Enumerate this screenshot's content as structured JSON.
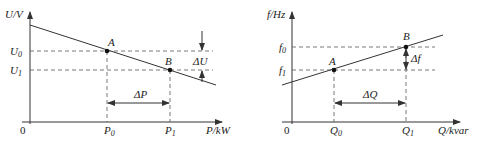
{
  "colors": {
    "line": "#333333",
    "dash": "#555555",
    "text": "#222222",
    "background": "#ffffff"
  },
  "left_chart": {
    "y_axis_label": "U/V",
    "x_axis_label": "P/kW",
    "origin_label": "0",
    "y_ticks": [
      {
        "base": "U",
        "sub": "0"
      },
      {
        "base": "U",
        "sub": "1"
      }
    ],
    "x_ticks": [
      {
        "base": "P",
        "sub": "0"
      },
      {
        "base": "P",
        "sub": "1"
      }
    ],
    "points": [
      {
        "label": "A"
      },
      {
        "label": "B"
      }
    ],
    "delta_x_label": "ΔP",
    "delta_y_label": "ΔU",
    "line_trend": "decreasing"
  },
  "right_chart": {
    "y_axis_label": "f/Hz",
    "x_axis_label": "Q/kvar",
    "origin_label": "0",
    "y_ticks": [
      {
        "base": "f",
        "sub": "0"
      },
      {
        "base": "f",
        "sub": "1"
      }
    ],
    "x_ticks": [
      {
        "base": "Q",
        "sub": "0"
      },
      {
        "base": "Q",
        "sub": "1"
      }
    ],
    "points": [
      {
        "label": "A"
      },
      {
        "label": "B"
      }
    ],
    "delta_x_label": "ΔQ",
    "delta_y_label": "Δf",
    "line_trend": "increasing"
  }
}
